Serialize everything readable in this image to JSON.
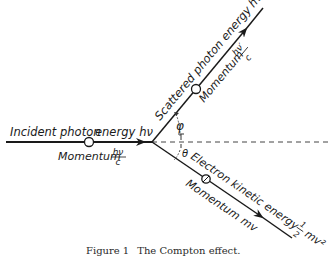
{
  "diagram": {
    "title": "The Compton effect",
    "incident": {
      "name": "Incident photon",
      "energy_label": "energy",
      "energy_symbol": "hν",
      "momentum_label": "Momentum",
      "momentum_num": "hν",
      "momentum_den": "c"
    },
    "scattered": {
      "name": "Scattered photon energy",
      "energy_symbol": "hν′",
      "momentum_label": "Momentum",
      "momentum_num": "hν′",
      "momentum_den": "c"
    },
    "electron": {
      "name": "Electron kinetic energy",
      "half_num": "1",
      "half_den": "2",
      "energy_symbol": "mv²",
      "momentum_label": "Momentum",
      "momentum_symbol": "mv"
    },
    "angles": {
      "phi": "φ",
      "theta": "θ"
    }
  },
  "caption": {
    "figure_label": "Figure 1",
    "text": "The Compton effect."
  },
  "colors": {
    "line": "#1a1a1a",
    "background": "#ffffff"
  }
}
